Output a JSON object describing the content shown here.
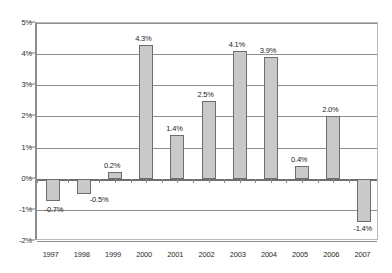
{
  "chart_data": {
    "type": "bar",
    "title": "",
    "subtitle": "",
    "xlabel": "",
    "ylabel": "",
    "categories": [
      "1997",
      "1998",
      "1999",
      "2000",
      "2001",
      "2002",
      "2003",
      "2004",
      "2005",
      "2006",
      "2007"
    ],
    "values": [
      -0.7,
      -0.5,
      0.2,
      4.3,
      1.4,
      2.5,
      4.1,
      3.9,
      0.4,
      2.0,
      -1.4
    ],
    "data_labels": [
      "-0.7%",
      "-0.5%",
      "0.2%",
      "4.3%",
      "1.4%",
      "2.5%",
      "4.1%",
      "3.9%",
      "0.4%",
      "2.0%",
      "-1.4%"
    ],
    "ylim": [
      -2,
      5
    ],
    "ytick_values": [
      5,
      4,
      3,
      2,
      1,
      0,
      -1,
      -2
    ],
    "ytick_labels": [
      "5%",
      "4%",
      "3%",
      "2%",
      "1%",
      "0%",
      "-1%",
      "-2%"
    ],
    "grid": true,
    "legend": null,
    "legend_position": "none",
    "colors": {
      "bar_fill": "#c9c9c9",
      "bar_stroke": "#6d6d6d",
      "gridline": "#8f8f8f",
      "zero_line": "#6f6f6f",
      "axis": "#8d8d8d",
      "text": "#2b2b2b",
      "background": "#ffffff"
    }
  }
}
